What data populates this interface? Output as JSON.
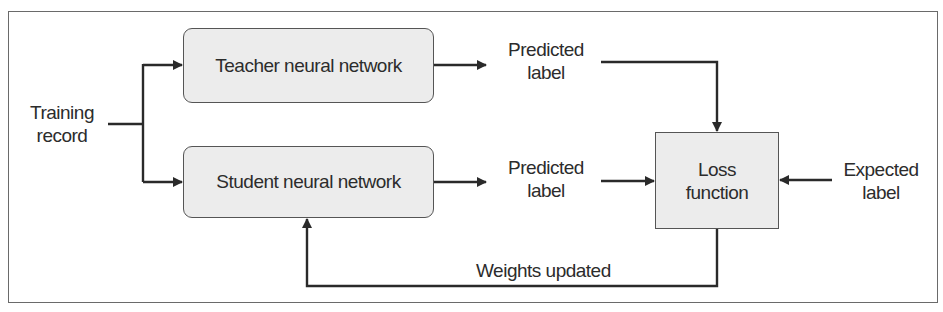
{
  "diagram": {
    "training_input": {
      "line1": "Training",
      "line2": "record"
    },
    "teacher": {
      "label": "Teacher neural network"
    },
    "student": {
      "label": "Student neural network"
    },
    "teacher_output": {
      "line1": "Predicted",
      "line2": "label"
    },
    "student_output": {
      "line1": "Predicted",
      "line2": "label"
    },
    "loss": {
      "line1": "Loss",
      "line2": "function"
    },
    "expected": {
      "line1": "Expected",
      "line2": "label"
    },
    "feedback": {
      "label": "Weights updated"
    },
    "colors": {
      "box_fill": "#ececec",
      "stroke": "#2a2a2a",
      "frame": "#6a6a6a"
    }
  }
}
